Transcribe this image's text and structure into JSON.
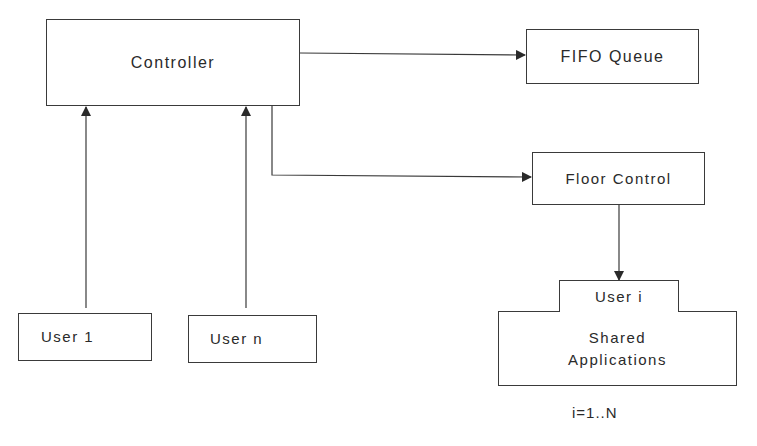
{
  "diagram": {
    "nodes": {
      "controller": "Controller",
      "fifo_queue": "FIFO Queue",
      "floor_control": "Floor Control",
      "user_1": "User 1",
      "user_n": "User n",
      "user_i": "User i",
      "shared_applications_line1": "Shared",
      "shared_applications_line2": "Applications"
    },
    "annotation": "i=1..N",
    "edges": [
      {
        "from": "Controller",
        "to": "FIFO Queue"
      },
      {
        "from": "Controller",
        "to": "Floor Control"
      },
      {
        "from": "User 1",
        "to": "Controller"
      },
      {
        "from": "User n",
        "to": "Controller"
      },
      {
        "from": "Floor Control",
        "to": "User i"
      }
    ],
    "colors": {
      "stroke": "#3a3a3a",
      "background": "#ffffff",
      "text": "#2a2a2a"
    }
  }
}
